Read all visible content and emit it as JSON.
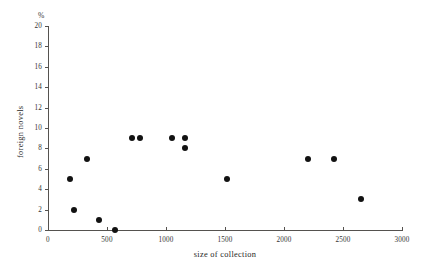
{
  "chart_data": {
    "type": "scatter",
    "title": "",
    "xlabel": "size of collection",
    "ylabel": "foreign novels",
    "unit_symbol": "%",
    "xlim": [
      0,
      3000
    ],
    "ylim": [
      0,
      20
    ],
    "xticks": [
      0,
      500,
      1000,
      1500,
      2000,
      2500,
      3000
    ],
    "xtick_labels": [
      "0",
      "500",
      "1000",
      "1500",
      "2000",
      "2500",
      "3000"
    ],
    "yticks": [
      0,
      2,
      4,
      6,
      8,
      10,
      12,
      14,
      16,
      18,
      20
    ],
    "ytick_labels": [
      "0",
      "2",
      "4",
      "6",
      "8",
      "10",
      "12",
      "14",
      "16",
      "18",
      "20"
    ],
    "grid": false,
    "legend": null,
    "marker": "filled-circle",
    "marker_color": "#121212",
    "axis_color": "#55524f",
    "background_color": "#ffffff",
    "points": [
      {
        "x": 190,
        "y": 5
      },
      {
        "x": 220,
        "y": 2
      },
      {
        "x": 330,
        "y": 7
      },
      {
        "x": 430,
        "y": 1
      },
      {
        "x": 570,
        "y": 0
      },
      {
        "x": 710,
        "y": 9
      },
      {
        "x": 780,
        "y": 9
      },
      {
        "x": 1050,
        "y": 9
      },
      {
        "x": 1160,
        "y": 9
      },
      {
        "x": 1160,
        "y": 8
      },
      {
        "x": 1520,
        "y": 5
      },
      {
        "x": 2200,
        "y": 7
      },
      {
        "x": 2420,
        "y": 7
      },
      {
        "x": 2650,
        "y": 3
      }
    ]
  },
  "layout": {
    "plot_left_px": 48,
    "plot_right_px": 402,
    "plot_bottom_px": 230,
    "plot_top_px": 26
  }
}
